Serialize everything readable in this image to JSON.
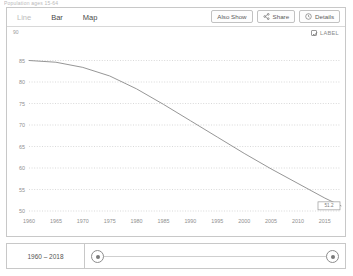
{
  "topstrip": {
    "text": "Population ages 15-64"
  },
  "toolbar": {
    "tabs": [
      {
        "label": "Line",
        "active": true
      },
      {
        "label": "Bar",
        "active": false
      },
      {
        "label": "Map",
        "active": false
      }
    ],
    "buttons": [
      {
        "label": "Also Show",
        "icon": "none"
      },
      {
        "label": "Share",
        "icon": "share-icon"
      },
      {
        "label": "Details",
        "icon": "info-icon"
      }
    ]
  },
  "chart_controls": {
    "label_toggle": {
      "label": "LABEL",
      "checked": true,
      "icon": "checkbox-checked-icon"
    },
    "y_axis_corner": "90"
  },
  "footer": {
    "range_label": "1960 – 2018",
    "slider": {
      "left_handle": "slider-handle-start",
      "right_handle": "slider-handle-end"
    }
  },
  "chart_data": {
    "type": "line",
    "title": "",
    "xlabel": "",
    "ylabel": "",
    "xlim": [
      1960,
      2018
    ],
    "ylim": [
      50,
      90
    ],
    "grid": true,
    "legend": false,
    "xticks": [
      1960,
      1965,
      1970,
      1975,
      1980,
      1985,
      1990,
      1995,
      2000,
      2005,
      2010,
      2015
    ],
    "yticks": [
      85,
      80,
      75,
      70,
      65,
      60,
      55,
      50
    ],
    "line_color": "#8a8a8a",
    "annotation": {
      "text": "51.2",
      "x": 2018,
      "y": 51.2
    },
    "x": [
      1960,
      1965,
      1970,
      1975,
      1980,
      1985,
      1990,
      1995,
      2000,
      2005,
      2010,
      2015,
      2018
    ],
    "values": [
      85.0,
      84.6,
      83.4,
      81.4,
      78.4,
      74.8,
      71.0,
      67.2,
      63.4,
      59.8,
      56.4,
      53.0,
      51.2
    ]
  }
}
